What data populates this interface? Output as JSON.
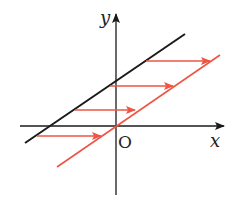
{
  "diagram": {
    "title": "",
    "axes": {
      "x_label": "x",
      "y_label": "y",
      "origin_label": "O"
    },
    "colors": {
      "axis": "#1a1a1a",
      "original_line": "#1a1a1a",
      "shifted_line": "#ee5545",
      "arrows": "#ee5545"
    },
    "lines": [
      {
        "name": "original-line",
        "color": "black",
        "description": "line with positive slope and positive y-intercept"
      },
      {
        "name": "translated-line",
        "color": "red",
        "description": "same line translated horizontally to the right, passing through origin"
      }
    ],
    "arrows": {
      "count": 4,
      "direction": "right",
      "description": "horizontal translation arrows from black line to red line"
    }
  }
}
